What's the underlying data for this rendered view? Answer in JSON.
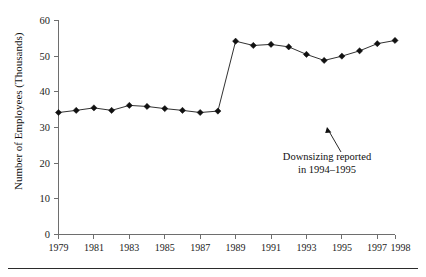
{
  "chart_data": {
    "type": "line",
    "title": "",
    "subtitle": "",
    "xlabel": "",
    "ylabel": "Number of Employees (Thousands)",
    "x": [
      1979,
      1980,
      1981,
      1982,
      1983,
      1984,
      1985,
      1986,
      1987,
      1988,
      1989,
      1990,
      1991,
      1992,
      1993,
      1994,
      1995,
      1996,
      1997,
      1998
    ],
    "values": [
      34.2,
      34.8,
      35.5,
      34.8,
      36.2,
      35.9,
      35.3,
      34.8,
      34.2,
      34.6,
      54.2,
      53.0,
      53.3,
      52.6,
      50.5,
      48.8,
      50.0,
      51.5,
      53.5,
      54.4
    ],
    "series": [
      {
        "name": "Number of Employees (Thousands)",
        "values": [
          34.2,
          34.8,
          35.5,
          34.8,
          36.2,
          35.9,
          35.3,
          34.8,
          34.2,
          34.6,
          54.2,
          53.0,
          53.3,
          52.6,
          50.5,
          48.8,
          50.0,
          51.5,
          53.5,
          54.4
        ]
      }
    ],
    "xlim": [
      1979,
      1998
    ],
    "ylim": [
      0,
      60
    ],
    "ytick_labels": [
      "0",
      "10",
      "20",
      "30",
      "40",
      "50",
      "60"
    ],
    "ytick_values": [
      0,
      10,
      20,
      30,
      40,
      50,
      60
    ],
    "xtick_labels": [
      "1979",
      "1981",
      "1983",
      "1985",
      "1987",
      "1989",
      "1991",
      "1993",
      "1995",
      "1997",
      "1998"
    ],
    "xtick_values": [
      1979,
      1981,
      1983,
      1985,
      1987,
      1989,
      1991,
      1993,
      1995,
      1997,
      1998
    ],
    "grid": false,
    "legend": false,
    "legend_position": "none",
    "marker": "diamond",
    "line_color": "#111111",
    "marker_color": "#111111",
    "axis_color": "#6e6e6e",
    "background_color": "#ffffff",
    "annotations": [
      {
        "name": "downsizing-note",
        "line1": "Downsizing reported",
        "line2": "in 1994–1995",
        "points_to_year": 1994,
        "points_to_value": 48.8
      }
    ]
  }
}
